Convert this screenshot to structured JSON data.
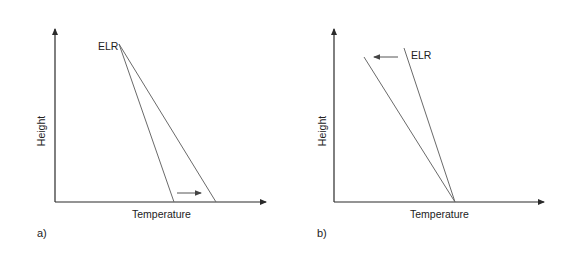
{
  "figure": {
    "panels": [
      {
        "id": "a",
        "panel_label": "a)",
        "x_axis_label": "Temperature",
        "y_axis_label": "Height",
        "line_label": "ELR",
        "arrow_direction": "right"
      },
      {
        "id": "b",
        "panel_label": "b)",
        "x_axis_label": "Temperature",
        "y_axis_label": "Height",
        "line_label": "ELR",
        "arrow_direction": "left"
      }
    ],
    "colors": {
      "axis": "#2a2a2a",
      "line": "#6a6a6a",
      "text": "#222222",
      "arrow": "#555555"
    }
  }
}
